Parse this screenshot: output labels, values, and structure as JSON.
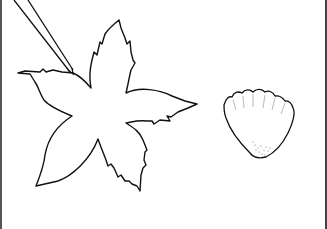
{
  "illustration": {
    "subjects": [
      "leaf-outline",
      "pointer-stick",
      "shell-petal-outline"
    ],
    "colors": {
      "background": "#ffffff",
      "stroke": "#111111",
      "border": "#555555"
    }
  }
}
